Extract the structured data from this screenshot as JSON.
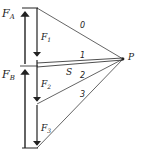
{
  "diagram": {
    "type": "force-polygon-funicular",
    "labels": {
      "FA": "F",
      "FA_sub": "A",
      "FB": "F",
      "FB_sub": "B",
      "F1": "F",
      "F1_sub": "1",
      "F2": "F",
      "F2_sub": "2",
      "F3": "F",
      "F3_sub": "3",
      "S": "S",
      "P": "P",
      "ray0": "0",
      "ray1": "1",
      "ray2": "2",
      "ray3": "3"
    },
    "pole": {
      "name": "P",
      "x": 123,
      "y": 59
    },
    "load_line": {
      "x": 37,
      "top": 8,
      "bottom": 148,
      "points_y": [
        8,
        59,
        104,
        148
      ]
    },
    "reaction_line": {
      "x": 25
    },
    "colors": {
      "line": "#222222",
      "background": "#ffffff"
    }
  }
}
